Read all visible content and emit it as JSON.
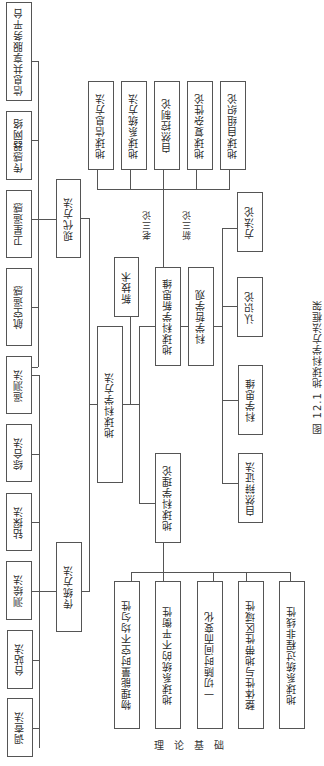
{
  "diagram": {
    "caption": "图 12.1  地球科学方法框架",
    "root": "地球科学方法",
    "methods": {
      "modern": {
        "label": "现代方法",
        "children": [
          "信息共享服务平台",
          "传感器网络",
          "卫星遥感",
          "航空遥感",
          "遥测法"
        ]
      },
      "traditional": {
        "label": "传统方法",
        "children": [
          "综合法",
          "钻探法",
          "测绘法",
          "台站法",
          "调查法"
        ]
      }
    },
    "new_tech": "新技术",
    "new_thinking": {
      "label": "地球科学新思维",
      "old_three": "老三论",
      "new_three": "新三论",
      "children": [
        "地球信息方法",
        "地球系统方法",
        "自然控制论",
        "地球复杂性论",
        "地球自组织论"
      ]
    },
    "philosophy": {
      "label": "科学哲学观",
      "children": [
        "方法论",
        "认识论",
        "科学思维",
        "自然辩证法"
      ]
    },
    "theory": {
      "label": "地球科学理论",
      "children": [
        "物理能量时空不均匀性",
        "地球系统的不平衡性",
        "一切随时间而变化",
        "整体性与地带性区域性",
        "地球系统过程非线性"
      ]
    },
    "foundation_label": [
      "理",
      "论",
      "基",
      "础"
    ]
  }
}
